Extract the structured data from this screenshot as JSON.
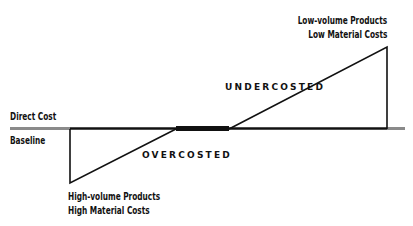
{
  "labels": {
    "direct_cost": "Direct Cost",
    "baseline": "Baseline",
    "overcosted": "OVERCOSTED",
    "undercosted": "UNDERCOSTED",
    "high_volume_line1": "High-volume Products",
    "high_volume_line2": "High Material Costs",
    "low_volume_line1": "Low-volume Products",
    "low_volume_line2": "Low Material Costs"
  },
  "colors": {
    "line": "#111111",
    "baseline_gray": "#8a8a8a"
  }
}
